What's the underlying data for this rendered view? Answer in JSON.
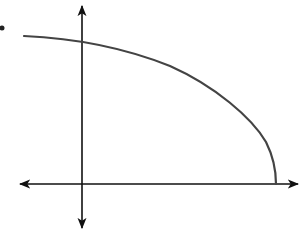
{
  "figure": {
    "type": "graph-sketch",
    "colors": {
      "axis": "#111111",
      "curve": "#444444",
      "background": "#ffffff",
      "marker": "#222222"
    },
    "axes": {
      "x_axis": {
        "y": 184,
        "x_start": 18,
        "x_end": 299,
        "arrows": "both"
      },
      "y_axis": {
        "x": 82,
        "y_start": 5,
        "y_end": 229,
        "arrows": "both"
      }
    },
    "curve": {
      "start": [
        24,
        36
      ],
      "y_intercept": [
        82,
        42
      ],
      "x_intercept": [
        276,
        184
      ],
      "shape": "concave-down, decreasing, meets x-axis vertically"
    },
    "marker": {
      "x": 2,
      "y": 28,
      "label": ""
    }
  }
}
